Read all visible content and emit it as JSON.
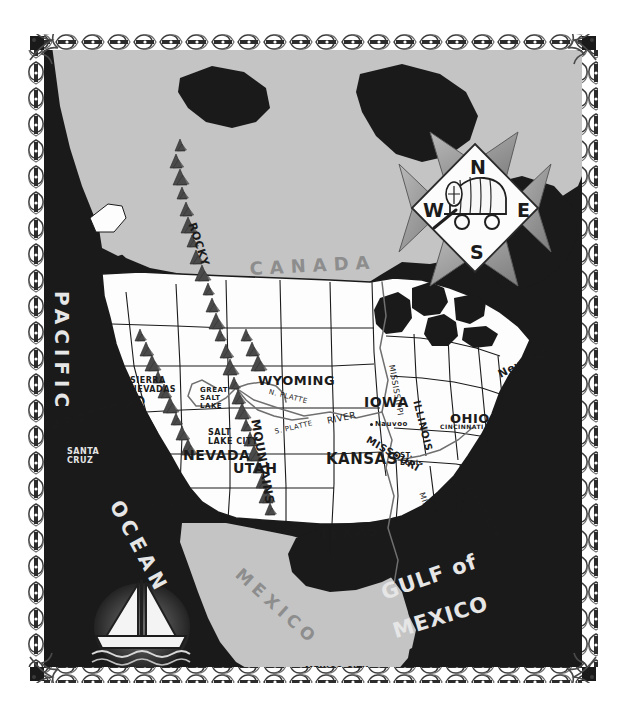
{
  "map": {
    "style": "hand-drawn vintage pioneer trail map of North America",
    "colors": {
      "ocean": "#1a1a1a",
      "land_foreign": "#c4c4c4",
      "land_usa": "#fdfdfd",
      "ink": "#1b1b1b",
      "ocean_text": "#e6e6e6",
      "land_text": "#8d8d8d",
      "paper": "#ffffff",
      "star": "#9a9a9a"
    },
    "water_labels": [
      {
        "name": "pacific-ocean-label-pacific",
        "text": "PACIFIC",
        "x": 44,
        "y": 255,
        "size": 20,
        "rot": 90,
        "spread": 5
      },
      {
        "name": "pacific-ocean-label-ocean",
        "text": "OCEAN",
        "x": 96,
        "y": 460,
        "size": 20,
        "rot": 62,
        "spread": 5
      },
      {
        "name": "gulf-of-mexico-label-gulf",
        "text": "GULF of",
        "x": 348,
        "y": 546,
        "size": 21,
        "rot": -19,
        "spread": 1
      },
      {
        "name": "gulf-of-mexico-label-mexico",
        "text": "MEXICO",
        "x": 360,
        "y": 584,
        "size": 21,
        "rot": -17,
        "spread": 1
      }
    ],
    "region_labels": [
      {
        "name": "canada-label",
        "text": "CANADA",
        "x": 219,
        "y": 222,
        "size": 18,
        "rot": -3,
        "spread": 7
      },
      {
        "name": "mexico-label",
        "text": "MEXICO",
        "x": 215,
        "y": 528,
        "size": 17,
        "rot": 42,
        "spread": 5
      }
    ],
    "states": [
      {
        "name": "state-label-california",
        "text": "CALIFORNIA",
        "x": 113,
        "y": 358,
        "size": 13,
        "rot": 74,
        "vertical": true
      },
      {
        "name": "state-label-nevada",
        "text": "NEVADA",
        "x": 153,
        "y": 411,
        "size": 14,
        "rot": 0
      },
      {
        "name": "state-label-utah",
        "text": "UTAH",
        "x": 203,
        "y": 424,
        "size": 14,
        "rot": 0
      },
      {
        "name": "state-label-wyoming",
        "text": "WYOMING",
        "x": 228,
        "y": 337,
        "size": 13,
        "rot": 0
      },
      {
        "name": "state-label-kansas",
        "text": "KANSAS",
        "x": 296,
        "y": 414,
        "size": 15,
        "rot": 0
      },
      {
        "name": "state-label-texas",
        "text": "TEXAS",
        "x": 288,
        "y": 489,
        "size": 16,
        "rot": -4
      },
      {
        "name": "state-label-iowa",
        "text": "IOWA",
        "x": 334,
        "y": 358,
        "size": 14,
        "rot": 0
      },
      {
        "name": "state-label-missouri",
        "text": "MISSOURI",
        "x": 340,
        "y": 398,
        "size": 10,
        "rot": 30
      },
      {
        "name": "state-label-illinois",
        "text": "ILLINOIS",
        "x": 392,
        "y": 363,
        "size": 10,
        "rot": 76
      },
      {
        "name": "state-label-ohio",
        "text": "OHIO",
        "x": 420,
        "y": 375,
        "size": 13,
        "rot": 0
      },
      {
        "name": "state-label-georgia",
        "text": "GEORGIA",
        "x": 443,
        "y": 448,
        "size": 11,
        "rot": 58
      },
      {
        "name": "state-label-new-york",
        "text": "New York",
        "x": 466,
        "y": 333,
        "size": 11,
        "rot": -27
      }
    ],
    "cities": [
      {
        "name": "city-label-santa-cruz",
        "text": "SANTA\nCRUZ",
        "x": 37,
        "y": 411,
        "size": 8,
        "ocean": true
      },
      {
        "name": "city-label-los-angeles",
        "text": "Los\nAngeles",
        "x": 120,
        "y": 455,
        "size": 8,
        "dot": true
      },
      {
        "name": "city-label-salt-lake-city",
        "text": "SALT\nLAKE CITY",
        "x": 178,
        "y": 392,
        "size": 8
      },
      {
        "name": "city-label-nauvoo",
        "text": "Nauvoo",
        "x": 345,
        "y": 384,
        "size": 7,
        "dot": true
      },
      {
        "name": "city-label-st-louis",
        "text": "ST.\nLouis",
        "x": 370,
        "y": 415,
        "size": 7,
        "dot": true
      },
      {
        "name": "city-label-cincinnati",
        "text": "CINCINNATI",
        "x": 410,
        "y": 387,
        "size": 6
      },
      {
        "name": "city-label-mexico-city",
        "text": "MEXICO CITY",
        "x": 275,
        "y": 630,
        "size": 8,
        "dot": true
      }
    ],
    "features": [
      {
        "name": "feature-label-sierra-nevadas",
        "text": "SIERRA\nNEVADAS",
        "x": 100,
        "y": 340,
        "size": 8
      },
      {
        "name": "feature-label-great-salt-lake",
        "text": "GREAT\nSALT\nLAKE",
        "x": 170,
        "y": 350,
        "size": 7
      },
      {
        "name": "feature-label-rocky",
        "text": "ROCKY",
        "x": 168,
        "y": 185,
        "size": 11,
        "rot": 72
      },
      {
        "name": "feature-label-mountains",
        "text": "MOUNTAINS",
        "x": 232,
        "y": 382,
        "size": 12,
        "rot": 80
      }
    ],
    "rivers": [
      {
        "name": "river-label-mississippi-north",
        "text": "MISSISSIPPI",
        "x": 366,
        "y": 328,
        "size": 8,
        "rot": 80
      },
      {
        "name": "river-label-mississippi-south",
        "text": "MISSISSIPPI",
        "x": 396,
        "y": 455,
        "size": 8,
        "rot": 72
      },
      {
        "name": "river-label-n-platte",
        "text": "N. PLATTE",
        "x": 240,
        "y": 352,
        "size": 7,
        "rot": 14
      },
      {
        "name": "river-label-s-platte",
        "text": "S. PLATTE",
        "x": 244,
        "y": 392,
        "size": 7,
        "rot": -13
      },
      {
        "name": "river-label-river",
        "text": "RIVER",
        "x": 296,
        "y": 380,
        "size": 9,
        "rot": -12
      }
    ],
    "compass": {
      "name": "compass-rose",
      "cx": 445,
      "cy": 172,
      "r": 62,
      "north": "N",
      "east": "E",
      "south": "S",
      "west": "W",
      "center_icon": "covered-wagon-icon"
    },
    "vignette": {
      "name": "sailboat-vignette",
      "icon": "sailboat-icon",
      "cx": 112,
      "cy": 591,
      "r": 47
    }
  }
}
